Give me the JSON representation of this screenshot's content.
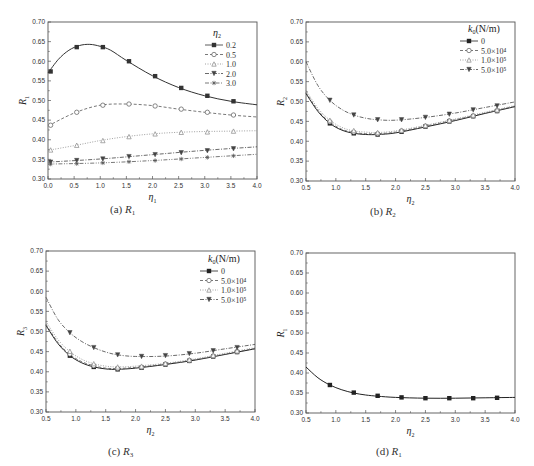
{
  "chart_data": [
    {
      "id": "a",
      "type": "line",
      "caption": "(a) R1",
      "caption_prefix": "(a)",
      "caption_var": "R",
      "caption_sub": "1",
      "xlabel": "η",
      "xlabel_sub": "1",
      "ylabel": "R",
      "ylabel_sub": "1",
      "xlim": [
        0.0,
        4.0
      ],
      "ylim": [
        0.3,
        0.7
      ],
      "xticks": [
        "0.0",
        "0.5",
        "1.0",
        "1.5",
        "2.0",
        "2.5",
        "3.0",
        "3.5",
        "4.0"
      ],
      "yticks": [
        "0.30",
        "0.35",
        "0.40",
        "0.45",
        "0.50",
        "0.55",
        "0.60",
        "0.65",
        "0.70"
      ],
      "legend_title": "η",
      "legend_title_sub": "2",
      "legend_position": "upper right",
      "grid": false,
      "x": [
        0.05,
        0.55,
        1.05,
        1.55,
        2.05,
        2.55,
        3.05,
        3.55
      ],
      "series": [
        {
          "name": "0.2",
          "marker": "square",
          "dash": "solid",
          "color": "#333333",
          "curve": [
            [
              0.0,
              0.57
            ],
            [
              0.2,
              0.605
            ],
            [
              0.4,
              0.628
            ],
            [
              0.6,
              0.64
            ],
            [
              0.8,
              0.643
            ],
            [
              1.0,
              0.638
            ],
            [
              1.2,
              0.628
            ],
            [
              1.5,
              0.602
            ],
            [
              2.0,
              0.563
            ],
            [
              2.5,
              0.533
            ],
            [
              3.0,
              0.512
            ],
            [
              3.5,
              0.498
            ],
            [
              4.0,
              0.489
            ]
          ],
          "values": [
            0.574,
            0.636,
            0.636,
            0.6,
            0.562,
            0.532,
            0.512,
            0.498
          ]
        },
        {
          "name": "0.5",
          "marker": "circle",
          "dash": "dash",
          "color": "#555555",
          "curve": [
            [
              0.0,
              0.435
            ],
            [
              0.5,
              0.468
            ],
            [
              1.0,
              0.488
            ],
            [
              1.5,
              0.491
            ],
            [
              2.0,
              0.487
            ],
            [
              2.5,
              0.478
            ],
            [
              3.0,
              0.47
            ],
            [
              3.5,
              0.463
            ],
            [
              4.0,
              0.458
            ]
          ],
          "values": [
            0.437,
            0.47,
            0.488,
            0.491,
            0.486,
            0.478,
            0.47,
            0.463
          ]
        },
        {
          "name": "1.0",
          "marker": "triangle",
          "dash": "dot",
          "color": "#888888",
          "curve": [
            [
              0.0,
              0.373
            ],
            [
              0.5,
              0.385
            ],
            [
              1.0,
              0.398
            ],
            [
              1.5,
              0.408
            ],
            [
              2.0,
              0.415
            ],
            [
              2.5,
              0.419
            ],
            [
              3.0,
              0.421
            ],
            [
              3.5,
              0.422
            ],
            [
              4.0,
              0.423
            ]
          ],
          "values": [
            0.374,
            0.386,
            0.398,
            0.408,
            0.415,
            0.419,
            0.42,
            0.422
          ]
        },
        {
          "name": "2.0",
          "marker": "tri-down",
          "dash": "dashdot",
          "color": "#444444",
          "curve": [
            [
              0.0,
              0.343
            ],
            [
              1.0,
              0.351
            ],
            [
              2.0,
              0.362
            ],
            [
              3.0,
              0.373
            ],
            [
              4.0,
              0.382
            ]
          ],
          "values": [
            0.343,
            0.347,
            0.351,
            0.357,
            0.362,
            0.367,
            0.372,
            0.377
          ]
        },
        {
          "name": "3.0",
          "marker": "star",
          "dash": "dashdotdot",
          "color": "#555555",
          "curve": [
            [
              0.0,
              0.338
            ],
            [
              1.0,
              0.341
            ],
            [
              2.0,
              0.347
            ],
            [
              3.0,
              0.355
            ],
            [
              4.0,
              0.363
            ]
          ],
          "values": [
            0.338,
            0.339,
            0.341,
            0.344,
            0.347,
            0.351,
            0.355,
            0.359
          ]
        }
      ]
    },
    {
      "id": "b",
      "type": "line",
      "caption": "(b) R2",
      "caption_prefix": "(b)",
      "caption_var": "R",
      "caption_sub": "2",
      "xlabel": "η",
      "xlabel_sub": "2",
      "ylabel": "R",
      "ylabel_sub": "2",
      "xlim": [
        0.5,
        4.0
      ],
      "ylim": [
        0.3,
        0.7
      ],
      "xticks": [
        "0.5",
        "1.0",
        "1.5",
        "2.0",
        "2.5",
        "3.0",
        "3.5",
        "4.0"
      ],
      "yticks": [
        "0.30",
        "0.35",
        "0.40",
        "0.45",
        "0.50",
        "0.55",
        "0.60",
        "0.65",
        "0.70"
      ],
      "legend_title": "k",
      "legend_title_sub": "0",
      "legend_title_unit": "(N/m)",
      "legend_position": "upper right",
      "grid": false,
      "x": [
        0.9,
        1.3,
        1.7,
        2.1,
        2.5,
        2.9,
        3.3,
        3.7
      ],
      "series": [
        {
          "name": "0",
          "marker": "square",
          "dash": "solid",
          "color": "#222222",
          "curve": [
            [
              0.5,
              0.52
            ],
            [
              0.7,
              0.475
            ],
            [
              0.9,
              0.445
            ],
            [
              1.1,
              0.428
            ],
            [
              1.3,
              0.42
            ],
            [
              1.5,
              0.417
            ],
            [
              1.7,
              0.417
            ],
            [
              2.0,
              0.421
            ],
            [
              2.5,
              0.436
            ],
            [
              3.0,
              0.452
            ],
            [
              3.5,
              0.47
            ],
            [
              4.0,
              0.487
            ]
          ],
          "values": [
            0.445,
            0.42,
            0.417,
            0.424,
            0.437,
            0.45,
            0.463,
            0.476
          ]
        },
        {
          "name": "5.0×10⁴",
          "marker": "circle",
          "dash": "dash",
          "color": "#555555",
          "curve": [
            [
              0.5,
              0.523
            ],
            [
              0.7,
              0.478
            ],
            [
              0.9,
              0.448
            ],
            [
              1.1,
              0.43
            ],
            [
              1.3,
              0.422
            ],
            [
              1.5,
              0.419
            ],
            [
              1.7,
              0.419
            ],
            [
              2.0,
              0.423
            ],
            [
              2.5,
              0.438
            ],
            [
              3.0,
              0.454
            ],
            [
              3.5,
              0.471
            ],
            [
              4.0,
              0.488
            ]
          ],
          "values": [
            0.449,
            0.423,
            0.419,
            0.426,
            0.438,
            0.451,
            0.464,
            0.477
          ]
        },
        {
          "name": "1.0×10⁵",
          "marker": "triangle",
          "dash": "dot",
          "color": "#888888",
          "curve": [
            [
              0.5,
              0.528
            ],
            [
              0.7,
              0.483
            ],
            [
              0.9,
              0.453
            ],
            [
              1.1,
              0.435
            ],
            [
              1.3,
              0.426
            ],
            [
              1.5,
              0.423
            ],
            [
              1.7,
              0.422
            ],
            [
              2.0,
              0.426
            ],
            [
              2.5,
              0.44
            ],
            [
              3.0,
              0.456
            ],
            [
              3.5,
              0.473
            ],
            [
              4.0,
              0.49
            ]
          ],
          "values": [
            0.453,
            0.427,
            0.422,
            0.428,
            0.44,
            0.453,
            0.466,
            0.479
          ]
        },
        {
          "name": "5.0×10⁵",
          "marker": "tri-down",
          "dash": "dashdot",
          "color": "#444444",
          "curve": [
            [
              0.5,
              0.6
            ],
            [
              0.7,
              0.54
            ],
            [
              0.9,
              0.503
            ],
            [
              1.1,
              0.48
            ],
            [
              1.3,
              0.466
            ],
            [
              1.5,
              0.458
            ],
            [
              1.7,
              0.454
            ],
            [
              2.0,
              0.453
            ],
            [
              2.5,
              0.46
            ],
            [
              3.0,
              0.471
            ],
            [
              3.5,
              0.485
            ],
            [
              4.0,
              0.499
            ]
          ],
          "values": [
            0.503,
            0.466,
            0.454,
            0.454,
            0.46,
            0.468,
            0.479,
            0.489
          ]
        }
      ]
    },
    {
      "id": "c",
      "type": "line",
      "caption": "(c) R3",
      "caption_prefix": "(c)",
      "caption_var": "R",
      "caption_sub": "3",
      "xlabel": "η",
      "xlabel_sub": "2",
      "ylabel": "R",
      "ylabel_sub": "3",
      "xlim": [
        0.5,
        4.0
      ],
      "ylim": [
        0.3,
        0.7
      ],
      "xticks": [
        "0.5",
        "1.0",
        "1.5",
        "2.0",
        "2.5",
        "3.0",
        "3.5",
        "4.0"
      ],
      "yticks": [
        "0.30",
        "0.35",
        "0.40",
        "0.45",
        "0.50",
        "0.55",
        "0.60",
        "0.65",
        "0.70"
      ],
      "legend_title": "k",
      "legend_title_sub": "0",
      "legend_title_unit": "(N/m)",
      "legend_position": "upper right",
      "grid": false,
      "x": [
        0.9,
        1.3,
        1.7,
        2.1,
        2.5,
        2.9,
        3.3,
        3.7
      ],
      "series": [
        {
          "name": "0",
          "marker": "square",
          "dash": "solid",
          "color": "#222222",
          "curve": [
            [
              0.5,
              0.515
            ],
            [
              0.7,
              0.47
            ],
            [
              0.9,
              0.44
            ],
            [
              1.1,
              0.422
            ],
            [
              1.3,
              0.412
            ],
            [
              1.5,
              0.407
            ],
            [
              1.7,
              0.406
            ],
            [
              2.0,
              0.409
            ],
            [
              2.5,
              0.418
            ],
            [
              3.0,
              0.429
            ],
            [
              3.5,
              0.443
            ],
            [
              4.0,
              0.457
            ]
          ],
          "values": [
            0.44,
            0.412,
            0.406,
            0.41,
            0.418,
            0.427,
            0.438,
            0.449
          ]
        },
        {
          "name": "5.0×10⁴",
          "marker": "circle",
          "dash": "dash",
          "color": "#555555",
          "curve": [
            [
              0.5,
              0.518
            ],
            [
              0.7,
              0.473
            ],
            [
              0.9,
              0.443
            ],
            [
              1.1,
              0.425
            ],
            [
              1.3,
              0.415
            ],
            [
              1.5,
              0.409
            ],
            [
              1.7,
              0.408
            ],
            [
              2.0,
              0.411
            ],
            [
              2.5,
              0.419
            ],
            [
              3.0,
              0.43
            ],
            [
              3.5,
              0.444
            ],
            [
              4.0,
              0.458
            ]
          ],
          "values": [
            0.444,
            0.415,
            0.408,
            0.411,
            0.419,
            0.428,
            0.439,
            0.45
          ]
        },
        {
          "name": "1.0×10⁵",
          "marker": "triangle",
          "dash": "dot",
          "color": "#888888",
          "curve": [
            [
              0.5,
              0.525
            ],
            [
              0.7,
              0.48
            ],
            [
              0.9,
              0.45
            ],
            [
              1.1,
              0.431
            ],
            [
              1.3,
              0.42
            ],
            [
              1.5,
              0.414
            ],
            [
              1.7,
              0.412
            ],
            [
              2.0,
              0.414
            ],
            [
              2.5,
              0.421
            ],
            [
              3.0,
              0.432
            ],
            [
              3.5,
              0.446
            ],
            [
              4.0,
              0.46
            ]
          ],
          "values": [
            0.451,
            0.42,
            0.412,
            0.414,
            0.421,
            0.43,
            0.441,
            0.452
          ]
        },
        {
          "name": "5.0×10⁵",
          "marker": "tri-down",
          "dash": "dashdot",
          "color": "#444444",
          "curve": [
            [
              0.5,
              0.585
            ],
            [
              0.7,
              0.53
            ],
            [
              0.9,
              0.497
            ],
            [
              1.1,
              0.475
            ],
            [
              1.3,
              0.46
            ],
            [
              1.5,
              0.449
            ],
            [
              1.7,
              0.442
            ],
            [
              2.0,
              0.438
            ],
            [
              2.5,
              0.439
            ],
            [
              3.0,
              0.446
            ],
            [
              3.5,
              0.457
            ],
            [
              4.0,
              0.468
            ]
          ],
          "values": [
            0.497,
            0.46,
            0.442,
            0.438,
            0.44,
            0.445,
            0.452,
            0.46
          ]
        }
      ]
    },
    {
      "id": "d",
      "type": "line",
      "caption": "(d) R1",
      "caption_prefix": "(d)",
      "caption_var": "R",
      "caption_sub": "1",
      "xlabel": "η",
      "xlabel_sub": "2",
      "ylabel": "R",
      "ylabel_sub": "1",
      "xlim": [
        0.5,
        4.0
      ],
      "ylim": [
        0.3,
        0.7
      ],
      "xticks": [
        "0.5",
        "1.0",
        "1.5",
        "2.0",
        "2.5",
        "3.0",
        "3.5",
        "4.0"
      ],
      "yticks": [
        "0.30",
        "0.35",
        "0.40",
        "0.45",
        "0.50",
        "0.55",
        "0.60",
        "0.65",
        "0.70"
      ],
      "legend_title": "",
      "legend_position": "none",
      "grid": false,
      "x": [
        0.9,
        1.3,
        1.7,
        2.1,
        2.5,
        2.9,
        3.3,
        3.7
      ],
      "series": [
        {
          "name": "R1",
          "marker": "square",
          "dash": "solid",
          "color": "#222222",
          "curve": [
            [
              0.5,
              0.415
            ],
            [
              0.7,
              0.388
            ],
            [
              0.9,
              0.37
            ],
            [
              1.1,
              0.358
            ],
            [
              1.3,
              0.35
            ],
            [
              1.5,
              0.345
            ],
            [
              1.7,
              0.342
            ],
            [
              2.0,
              0.339
            ],
            [
              2.5,
              0.337
            ],
            [
              3.0,
              0.337
            ],
            [
              3.5,
              0.338
            ],
            [
              4.0,
              0.339
            ]
          ],
          "values": [
            0.37,
            0.351,
            0.343,
            0.339,
            0.337,
            0.337,
            0.337,
            0.338
          ]
        }
      ]
    }
  ],
  "layout": {
    "panels": [
      {
        "left": 48,
        "top": 22,
        "right": 257,
        "bottom": 179,
        "caption_x": 110,
        "caption_y": 213
      },
      {
        "left": 306,
        "top": 22,
        "right": 515,
        "bottom": 181,
        "caption_x": 370,
        "caption_y": 215
      },
      {
        "left": 46,
        "top": 251,
        "right": 255,
        "bottom": 412,
        "caption_x": 108,
        "caption_y": 455
      },
      {
        "left": 306,
        "top": 253,
        "right": 515,
        "bottom": 413,
        "caption_x": 376,
        "caption_y": 455
      }
    ],
    "legends": [
      {
        "x": 205,
        "y": 28
      },
      {
        "x": 460,
        "y": 24
      },
      {
        "x": 200,
        "y": 254
      },
      null
    ]
  }
}
